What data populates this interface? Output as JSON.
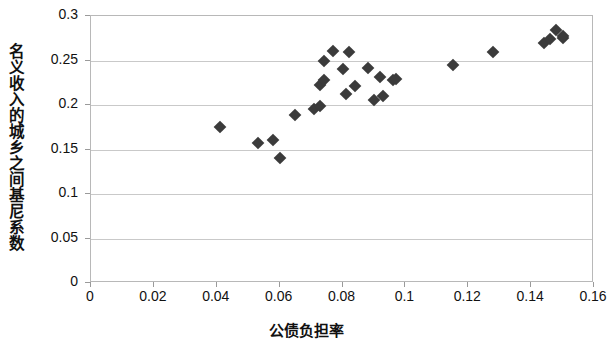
{
  "chart_data": {
    "type": "scatter",
    "title": "",
    "xlabel": "公债负担率",
    "ylabel": "名义收入的城乡之间基尼系数",
    "xlim": [
      0,
      0.16
    ],
    "ylim": [
      0,
      0.3
    ],
    "xticks": [
      "0",
      "0.02",
      "0.04",
      "0.06",
      "0.08",
      "0.1",
      "0.12",
      "0.14",
      "0.16"
    ],
    "xtick_values": [
      0,
      0.02,
      0.04,
      0.06,
      0.08,
      0.1,
      0.12,
      0.14,
      0.16
    ],
    "yticks": [
      "0",
      "0.05",
      "0.1",
      "0.15",
      "0.2",
      "0.25",
      "0.3"
    ],
    "ytick_values": [
      0,
      0.05,
      0.1,
      0.15,
      0.2,
      0.25,
      0.3
    ],
    "grid": "horizontal",
    "legend": "none",
    "marker": "diamond",
    "marker_color": "#3b3b3b",
    "series": [
      {
        "name": "观测点",
        "points": [
          [
            0.041,
            0.175
          ],
          [
            0.053,
            0.157
          ],
          [
            0.058,
            0.161
          ],
          [
            0.06,
            0.14
          ],
          [
            0.065,
            0.189
          ],
          [
            0.071,
            0.196
          ],
          [
            0.073,
            0.199
          ],
          [
            0.074,
            0.249
          ],
          [
            0.073,
            0.222
          ],
          [
            0.074,
            0.228
          ],
          [
            0.077,
            0.261
          ],
          [
            0.082,
            0.259
          ],
          [
            0.081,
            0.212
          ],
          [
            0.08,
            0.24
          ],
          [
            0.084,
            0.221
          ],
          [
            0.088,
            0.242
          ],
          [
            0.09,
            0.206
          ],
          [
            0.092,
            0.231
          ],
          [
            0.093,
            0.21
          ],
          [
            0.096,
            0.228
          ],
          [
            0.097,
            0.229
          ],
          [
            0.115,
            0.245
          ],
          [
            0.128,
            0.259
          ],
          [
            0.144,
            0.27
          ],
          [
            0.146,
            0.274
          ],
          [
            0.148,
            0.284
          ],
          [
            0.15,
            0.275
          ],
          [
            0.15,
            0.277
          ]
        ]
      }
    ]
  }
}
